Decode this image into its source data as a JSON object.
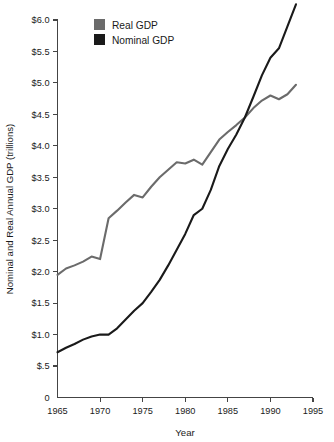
{
  "chart_data": {
    "type": "line",
    "title": "",
    "xlabel": "Year",
    "ylabel": "Nominal and Real Annual GDP (trillions)",
    "xlim": [
      1965,
      1995
    ],
    "ylim": [
      0,
      6.0
    ],
    "grid": false,
    "legend_position": "top-left-inside",
    "xticks": [
      1965,
      1970,
      1975,
      1980,
      1985,
      1990,
      1995
    ],
    "xticklabels": [
      "1965",
      "1970",
      "1975",
      "1980",
      "1985",
      "1990",
      "1995"
    ],
    "yticks": [
      0,
      0.5,
      1.0,
      1.5,
      2.0,
      2.5,
      3.0,
      3.5,
      4.0,
      4.5,
      5.0,
      5.5,
      6.0
    ],
    "yticklabels": [
      "0",
      "$.5",
      "$1.0",
      "$1.5",
      "$2.0",
      "$2.5",
      "$3.0",
      "$3.5",
      "$4.0",
      "$4.5",
      "$5.0",
      "$5.5",
      "$6.0"
    ],
    "x": [
      1965,
      1966,
      1967,
      1968,
      1969,
      1970,
      1971,
      1972,
      1973,
      1974,
      1975,
      1976,
      1977,
      1978,
      1979,
      1980,
      1981,
      1982,
      1983,
      1984,
      1985,
      1986,
      1987,
      1988,
      1989,
      1990,
      1991,
      1992,
      1993
    ],
    "series": [
      {
        "name": "Real GDP",
        "color": "#6b6b6b",
        "values": [
          1.95,
          2.05,
          2.1,
          2.16,
          2.24,
          2.2,
          2.85,
          2.97,
          3.1,
          3.22,
          3.18,
          3.35,
          3.5,
          3.62,
          3.74,
          3.72,
          3.78,
          3.7,
          3.9,
          4.1,
          4.22,
          4.33,
          4.45,
          4.6,
          4.72,
          4.8,
          4.74,
          4.82,
          4.97
        ]
      },
      {
        "name": "Nominal GDP",
        "color": "#1a1a1a",
        "values": [
          0.72,
          0.79,
          0.85,
          0.92,
          0.97,
          1.0,
          1.0,
          1.1,
          1.24,
          1.38,
          1.5,
          1.68,
          1.87,
          2.1,
          2.35,
          2.6,
          2.9,
          3.0,
          3.3,
          3.68,
          3.95,
          4.18,
          4.45,
          4.78,
          5.12,
          5.4,
          5.55,
          5.9,
          6.25
        ]
      }
    ]
  },
  "legend": {
    "items": [
      {
        "label": "Real GDP",
        "swatch_color": "#6b6b6b"
      },
      {
        "label": "Nominal GDP",
        "swatch_color": "#1a1a1a"
      }
    ]
  },
  "axes": {
    "x_title": "Year",
    "y_title": "Nominal and Real Annual GDP (trillions)"
  }
}
